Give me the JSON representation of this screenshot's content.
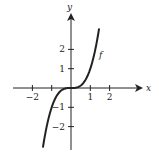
{
  "chart_data": {
    "type": "line",
    "title": "",
    "function_label": "f",
    "function": "x^3",
    "xlabel": "x",
    "ylabel": "y",
    "x_ticks": [
      -2,
      -1,
      1,
      2
    ],
    "x_tick_labels": [
      "−2",
      "",
      "1",
      "2"
    ],
    "y_ticks": [
      -2,
      -1,
      1,
      2
    ],
    "y_tick_labels": [
      "−2",
      "−1",
      "1",
      "2"
    ],
    "xlim": [
      -2.0,
      3.6
    ],
    "ylim": [
      -3.0,
      3.8
    ],
    "grid": false,
    "series": [
      {
        "name": "f",
        "x": [
          -1.45,
          -1.2,
          -1.0,
          -0.8,
          -0.6,
          -0.4,
          -0.2,
          0,
          0.2,
          0.4,
          0.6,
          0.8,
          1.0,
          1.2,
          1.45
        ],
        "y": [
          -3.05,
          -1.73,
          -1.0,
          -0.51,
          -0.22,
          -0.06,
          -0.01,
          0,
          0.01,
          0.06,
          0.22,
          0.51,
          1.0,
          1.73,
          3.05
        ]
      }
    ]
  }
}
